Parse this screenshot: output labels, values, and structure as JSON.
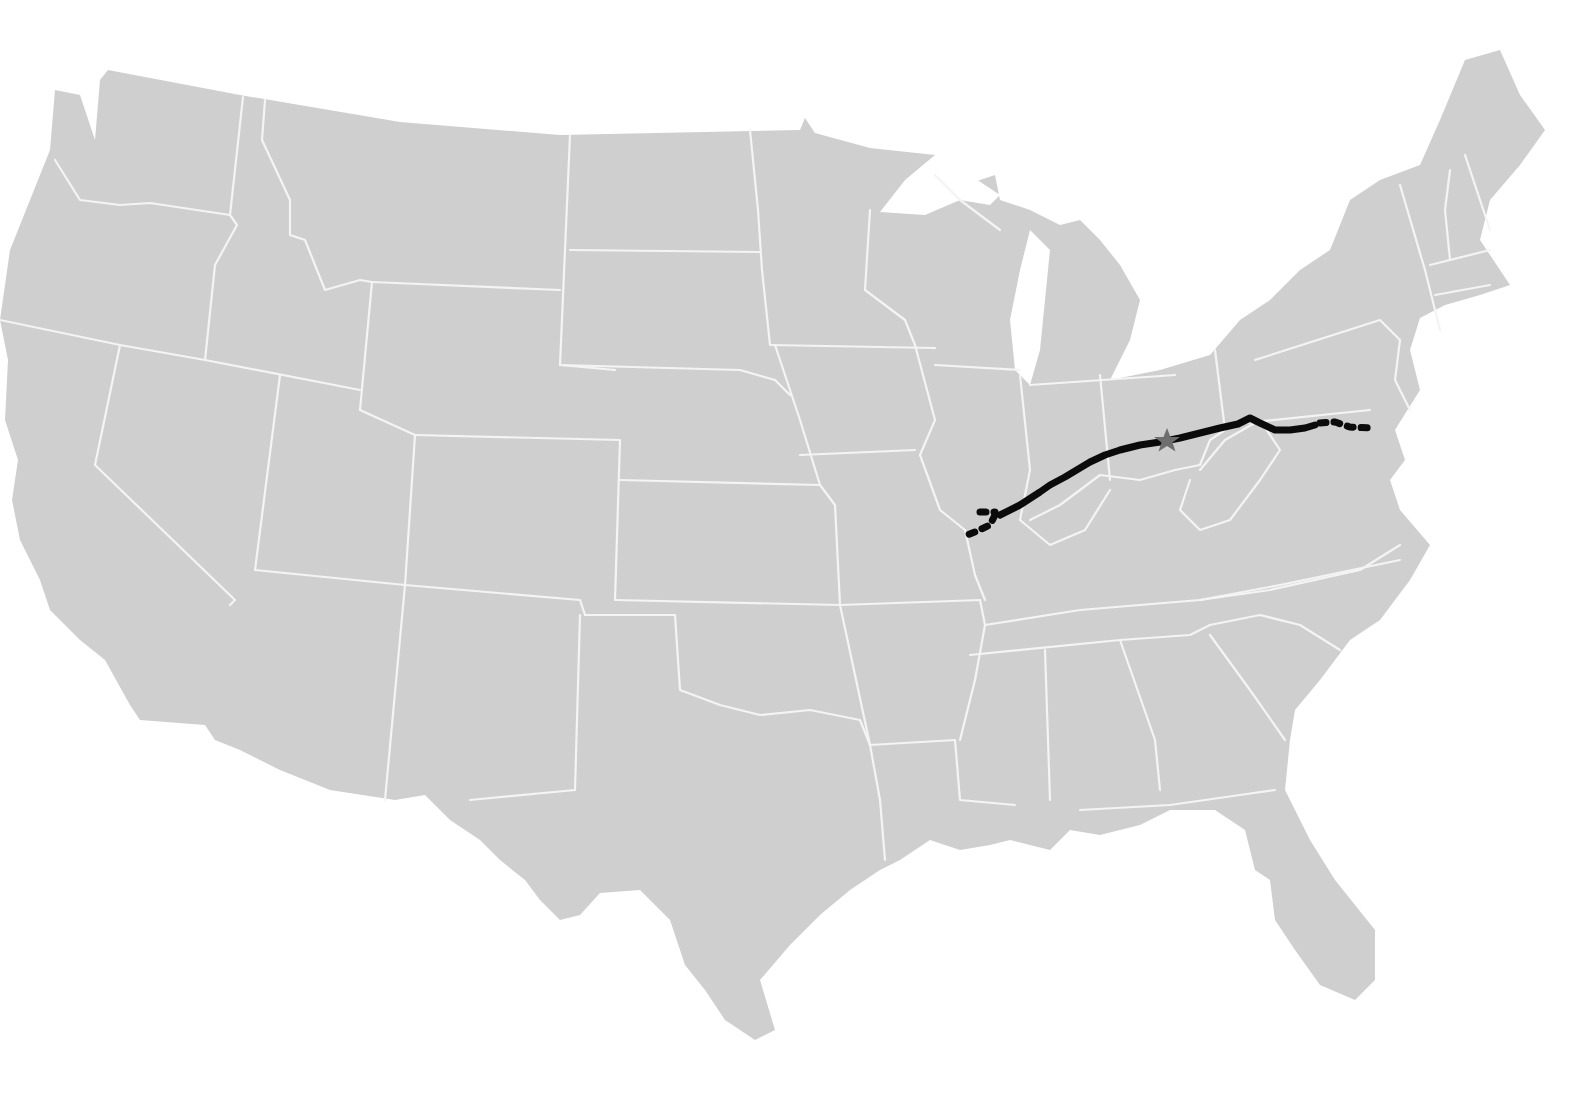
{
  "map": {
    "title": "",
    "region": "Contiguous United States",
    "colors": {
      "land": "#cfcfcf",
      "state_borders": "#f4f4f4",
      "background": "#ffffff",
      "route": "#0b0b0b",
      "marker": "#6e6e6e"
    },
    "route": {
      "name": "National Road",
      "style_main": "solid",
      "style_extensions": "dotted",
      "approx_path_states": [
        "Maryland",
        "Pennsylvania",
        "West Virginia",
        "Ohio",
        "Indiana",
        "Illinois"
      ]
    },
    "marker": {
      "icon": "star-icon",
      "location_state": "Ohio"
    },
    "labels": []
  }
}
